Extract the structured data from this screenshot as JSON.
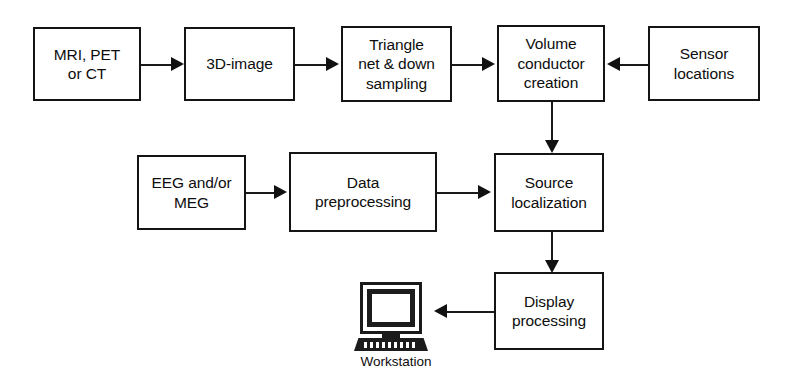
{
  "diagram": {
    "background_color": "#ffffff",
    "line_color": "#1a1a1a",
    "text_color": "#0d0d0d",
    "nodes": [
      {
        "id": "mri-pet-ct",
        "label": "MRI, PET\nor CT"
      },
      {
        "id": "3d-image",
        "label": "3D-image"
      },
      {
        "id": "triangle-net",
        "label": "Triangle\nnet & down\nsampling"
      },
      {
        "id": "volume-conductor",
        "label": "Volume\nconductor\ncreation"
      },
      {
        "id": "sensor-locations",
        "label": "Sensor\nlocations"
      },
      {
        "id": "eeg-meg",
        "label": "EEG and/or\nMEG"
      },
      {
        "id": "data-preprocessing",
        "label": "Data\npreprocessing"
      },
      {
        "id": "source-localization",
        "label": "Source\nlocalization"
      },
      {
        "id": "display-processing",
        "label": "Display\nprocessing"
      }
    ],
    "icon": {
      "name": "workstation-icon",
      "label": "Workstation"
    },
    "edges": [
      {
        "from": "mri-pet-ct",
        "to": "3d-image",
        "direction": "right"
      },
      {
        "from": "3d-image",
        "to": "triangle-net",
        "direction": "right"
      },
      {
        "from": "triangle-net",
        "to": "volume-conductor",
        "direction": "right"
      },
      {
        "from": "sensor-locations",
        "to": "volume-conductor",
        "direction": "left"
      },
      {
        "from": "volume-conductor",
        "to": "source-localization",
        "direction": "down"
      },
      {
        "from": "eeg-meg",
        "to": "data-preprocessing",
        "direction": "right"
      },
      {
        "from": "data-preprocessing",
        "to": "source-localization",
        "direction": "right"
      },
      {
        "from": "source-localization",
        "to": "display-processing",
        "direction": "down"
      },
      {
        "from": "display-processing",
        "to": "workstation",
        "direction": "left"
      }
    ]
  }
}
